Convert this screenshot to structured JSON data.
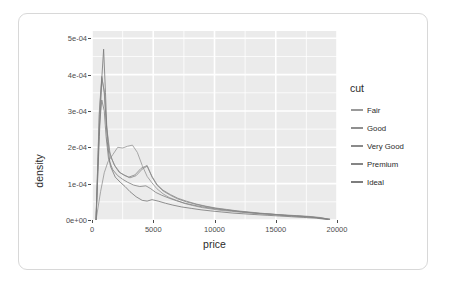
{
  "chart_data": {
    "type": "line",
    "title": "",
    "subtitle": "",
    "xlabel": "price",
    "ylabel": "density",
    "xlim": [
      0,
      20000
    ],
    "ylim": [
      0,
      0.00052
    ],
    "grid": true,
    "legend_position": "right",
    "legend_title": "cut",
    "x_ticks": [
      {
        "value": 0,
        "label": "0"
      },
      {
        "value": 5000,
        "label": "5000"
      },
      {
        "value": 10000,
        "label": "10000"
      },
      {
        "value": 15000,
        "label": "15000"
      },
      {
        "value": 20000,
        "label": "20000"
      }
    ],
    "y_ticks": [
      {
        "value": 0.0,
        "label": "0e+00"
      },
      {
        "value": 0.0001,
        "label": "1e-04"
      },
      {
        "value": 0.0002,
        "label": "2e-04"
      },
      {
        "value": 0.0003,
        "label": "3e-04"
      },
      {
        "value": 0.0004,
        "label": "4e-04"
      },
      {
        "value": 0.0005,
        "label": "5e-04"
      }
    ],
    "x_minor_ticks": [
      2500,
      7500,
      12500,
      17500
    ],
    "y_minor_ticks": [
      5e-05,
      0.00015,
      0.00025,
      0.00035,
      0.00045
    ],
    "panel_background": "#ebebeb",
    "grid_color": "#ffffff",
    "axis_text_color": "#4d4d4d",
    "axis_title_color": "#2b2b2b",
    "series": [
      {
        "name": "Fair",
        "color": "#9a9a9a",
        "x": [
          330,
          700,
          1000,
          1300,
          1700,
          2100,
          2500,
          2900,
          3300,
          3700,
          4100,
          4500,
          4900,
          5300,
          5800,
          6300,
          6900,
          7500,
          8200,
          9000,
          9800,
          10600,
          11400,
          12200,
          13000,
          13900,
          14800,
          15700,
          16600,
          17500,
          18400,
          19200
        ],
        "y": [
          0.0,
          7.8e-05,
          0.00013,
          0.00016,
          0.00018,
          0.0002,
          0.000198,
          0.000203,
          0.000206,
          0.000186,
          0.00015,
          0.00012,
          0.000102,
          8.6e-05,
          7.2e-05,
          6.2e-05,
          5.4e-05,
          4.6e-05,
          4e-05,
          3.4e-05,
          3e-05,
          2.6e-05,
          2.4e-05,
          2.1e-05,
          1.9e-05,
          1.7e-05,
          1.5e-05,
          1.3e-05,
          1.1e-05,
          9e-06,
          6e-06,
          2e-06
        ]
      },
      {
        "name": "Good",
        "color": "#8f8f8f",
        "x": [
          330,
          600,
          800,
          1000,
          1200,
          1500,
          1900,
          2300,
          2700,
          3100,
          3600,
          4100,
          4500,
          4900,
          5300,
          5800,
          6400,
          7000,
          7700,
          8500,
          9300,
          10100,
          11000,
          11900,
          12800,
          13700,
          14700,
          15700,
          16700,
          17700,
          18600,
          19400
        ],
        "y": [
          0.0,
          0.00029,
          0.00039,
          0.000355,
          0.000255,
          0.000175,
          0.000148,
          0.00013,
          0.000122,
          0.000116,
          0.000122,
          0.00014,
          0.000148,
          0.00012,
          9.8e-05,
          8.2e-05,
          7e-05,
          6e-05,
          5.2e-05,
          4.4e-05,
          3.8e-05,
          3.3e-05,
          2.9e-05,
          2.5e-05,
          2.2e-05,
          1.9e-05,
          1.6e-05,
          1.4e-05,
          1.2e-05,
          1e-05,
          7e-06,
          2e-06
        ]
      },
      {
        "name": "Very Good",
        "color": "#8a8a8a",
        "x": [
          330,
          600,
          800,
          1000,
          1150,
          1400,
          1800,
          2200,
          2600,
          3000,
          3500,
          4000,
          4500,
          4900,
          5300,
          5800,
          6400,
          7000,
          7700,
          8500,
          9300,
          10100,
          11000,
          11900,
          12800,
          13700,
          14700,
          15700,
          16700,
          17700,
          18600,
          19400
        ],
        "y": [
          0.0,
          0.0003,
          0.000395,
          0.00035,
          0.00027,
          0.00019,
          0.000152,
          0.000132,
          0.000124,
          0.000118,
          0.000124,
          0.000142,
          0.00015,
          0.000118,
          9.6e-05,
          8e-05,
          6.8e-05,
          5.8e-05,
          5e-05,
          4.3e-05,
          3.7e-05,
          3.2e-05,
          2.8e-05,
          2.4e-05,
          2.1e-05,
          1.8e-05,
          1.6e-05,
          1.3e-05,
          1.1e-05,
          9e-06,
          6e-06,
          2e-06
        ]
      },
      {
        "name": "Premium",
        "color": "#858585",
        "x": [
          330,
          600,
          800,
          1000,
          1150,
          1350,
          1700,
          2100,
          2500,
          2900,
          3400,
          3900,
          4400,
          4800,
          5200,
          5700,
          6300,
          6900,
          7600,
          8400,
          9200,
          10000,
          10900,
          11800,
          12700,
          13600,
          14600,
          15600,
          16600,
          17600,
          18500,
          19400
        ],
        "y": [
          0.0,
          0.000255,
          0.00033,
          0.0003,
          0.00023,
          0.000168,
          0.000138,
          0.000122,
          0.000112,
          0.000104,
          9.6e-05,
          9.2e-05,
          9.4e-05,
          8.6e-05,
          7.6e-05,
          6.8e-05,
          6e-05,
          5.3e-05,
          4.6e-05,
          4e-05,
          3.5e-05,
          3.1e-05,
          2.7e-05,
          2.4e-05,
          2.1e-05,
          1.8e-05,
          1.6e-05,
          1.3e-05,
          1.1e-05,
          9e-06,
          6e-06,
          2e-06
        ]
      },
      {
        "name": "Ideal",
        "color": "#7d7d7d",
        "x": [
          330,
          600,
          800,
          950,
          1100,
          1250,
          1500,
          1900,
          2300,
          2700,
          3100,
          3600,
          4100,
          4500,
          4900,
          5400,
          6000,
          6600,
          7300,
          8100,
          8900,
          9700,
          10600,
          11500,
          12400,
          13300,
          14300,
          15300,
          16300,
          17300,
          18300,
          19300
        ],
        "y": [
          0.0,
          0.00023,
          0.00039,
          0.00047,
          0.00035,
          0.000215,
          0.000148,
          0.000118,
          0.000104,
          9.2e-05,
          7.8e-05,
          6.4e-05,
          5.4e-05,
          5.2e-05,
          5.6e-05,
          5.2e-05,
          4.6e-05,
          4.1e-05,
          3.6e-05,
          3.2e-05,
          2.8e-05,
          2.5e-05,
          2.2e-05,
          1.9e-05,
          1.7e-05,
          1.5e-05,
          1.3e-05,
          1.1e-05,
          9e-06,
          7e-06,
          5e-06,
          1e-06
        ]
      }
    ]
  }
}
